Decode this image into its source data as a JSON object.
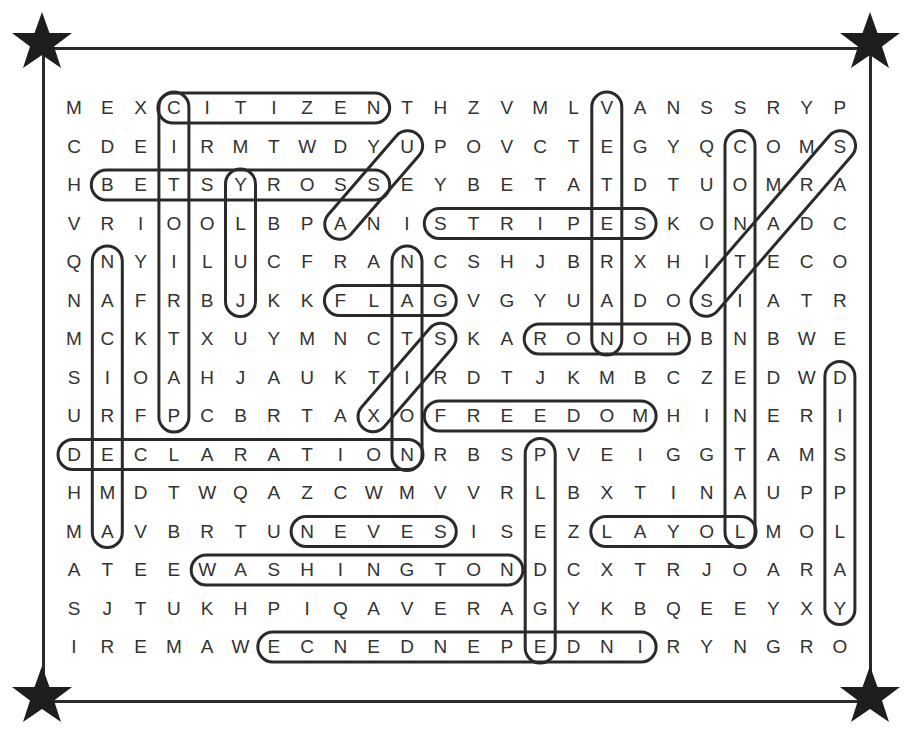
{
  "puzzle": {
    "rows": 15,
    "cols": 24,
    "grid": [
      "MEXCITIZENTHZVMLVANSSRYP",
      "CDEIRMTWDYUPOVCTEGYQCOMS",
      "HBETSYROSSEYBETATDTUOMRA",
      "VRIOOLBPANISTRIPESKONADC",
      "QNYILUCFRANCSHJBRXHITECO",
      "NAFRBJKKFLAGVGYUADOSIATR",
      "MCKTXUYMNCTSKARONOHBNBWE",
      "SIOAHJAUKTIRDTJKMBCZEDWD",
      "URFPCBRTAXOFREEDOMHINERI",
      "DECLARATIONRBSPVEIGGTAMS",
      "HMDTWQAZCWMVVRLBXTINAUPP",
      "MAVBRTUNEVESISEZLAYOLMOL",
      "ATEEWASHINGTONDCXTRJOARA",
      "SJTUKHPIQAVERAGYKBQEEYXY",
      "IREMAWECNEDNEPEDNIRYNGRO"
    ],
    "found_words": [
      {
        "word": "CITIZEN",
        "from": [
          0,
          3
        ],
        "to": [
          0,
          9
        ]
      },
      {
        "word": "PATRIOTIC",
        "from": [
          0,
          3
        ],
        "to": [
          8,
          3
        ]
      },
      {
        "word": "BETSY ROSS",
        "from": [
          2,
          1
        ],
        "to": [
          2,
          9
        ]
      },
      {
        "word": "JULY",
        "from": [
          2,
          5
        ],
        "to": [
          5,
          5
        ]
      },
      {
        "word": "USA",
        "from": [
          1,
          10
        ],
        "to": [
          3,
          8
        ]
      },
      {
        "word": "STRIPES",
        "from": [
          3,
          11
        ],
        "to": [
          3,
          17
        ]
      },
      {
        "word": "VETERAN",
        "from": [
          0,
          16
        ],
        "to": [
          6,
          16
        ]
      },
      {
        "word": "CONTINENTAL",
        "from": [
          1,
          20
        ],
        "to": [
          11,
          20
        ]
      },
      {
        "word": "STARS",
        "from": [
          1,
          23
        ],
        "to": [
          5,
          19
        ]
      },
      {
        "word": "AMERICAN",
        "from": [
          4,
          1
        ],
        "to": [
          11,
          1
        ]
      },
      {
        "word": "NATION",
        "from": [
          4,
          10
        ],
        "to": [
          9,
          10
        ]
      },
      {
        "word": "FLAG",
        "from": [
          5,
          8
        ],
        "to": [
          5,
          11
        ]
      },
      {
        "word": "HONOR",
        "from": [
          6,
          14
        ],
        "to": [
          6,
          18
        ]
      },
      {
        "word": "SIX",
        "from": [
          6,
          11
        ],
        "to": [
          8,
          9
        ]
      },
      {
        "word": "FREEDOM",
        "from": [
          8,
          11
        ],
        "to": [
          8,
          17
        ]
      },
      {
        "word": "DECLARATION",
        "from": [
          9,
          0
        ],
        "to": [
          9,
          10
        ]
      },
      {
        "word": "PLEDGE",
        "from": [
          9,
          14
        ],
        "to": [
          14,
          14
        ]
      },
      {
        "word": "DISPLAY",
        "from": [
          7,
          23
        ],
        "to": [
          13,
          23
        ]
      },
      {
        "word": "SEVEN",
        "from": [
          11,
          7
        ],
        "to": [
          11,
          11
        ]
      },
      {
        "word": "LOYAL",
        "from": [
          11,
          16
        ],
        "to": [
          11,
          20
        ]
      },
      {
        "word": "WASHINGTON",
        "from": [
          12,
          4
        ],
        "to": [
          12,
          13
        ]
      },
      {
        "word": "INDEPENDENCE",
        "from": [
          14,
          6
        ],
        "to": [
          14,
          17
        ]
      }
    ]
  },
  "layout": {
    "x0": 74,
    "dx": 33.3,
    "y0": 108,
    "dy": 38.5,
    "ink": "#2a2a2a",
    "letter_color": "#333333"
  },
  "decorations": {
    "corner_stars": [
      "top-left",
      "top-right",
      "bottom-left",
      "bottom-right"
    ]
  }
}
